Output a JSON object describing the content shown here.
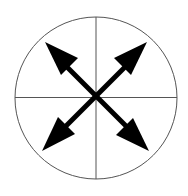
{
  "diagram": {
    "circle": {
      "cx": 96,
      "cy": 98,
      "r": 81,
      "stroke": "#555555"
    },
    "axes": {
      "stroke": "#555555"
    },
    "arrows": {
      "color": "#000000",
      "center": [
        96,
        97
      ],
      "tips": [
        {
          "direction": "up-left",
          "x": 45,
          "y": 42
        },
        {
          "direction": "up-right",
          "x": 147,
          "y": 42
        },
        {
          "direction": "down-left",
          "x": 42,
          "y": 151
        },
        {
          "direction": "down-right",
          "x": 149,
          "y": 151
        }
      ]
    }
  }
}
